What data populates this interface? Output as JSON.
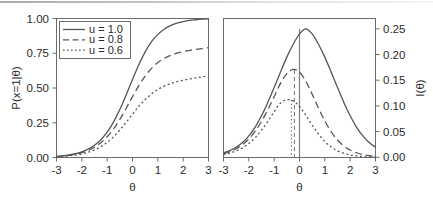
{
  "figure": {
    "background": "#ffffff",
    "ink_color": "#555555",
    "text_color": "#2b2b2b"
  },
  "chart_data": [
    {
      "type": "line",
      "panel": "left",
      "title": "",
      "xlabel": "θ",
      "ylabel": "P(x=1|θ)",
      "xlim": [
        -3,
        3
      ],
      "ylim": [
        0,
        1
      ],
      "xticks": [
        -3,
        -2,
        -1,
        0,
        1,
        2,
        3
      ],
      "xticklabels": [
        "-3",
        "-2",
        "-1",
        "0",
        "1",
        "2",
        "3"
      ],
      "yticks": [
        0.0,
        0.25,
        0.5,
        0.75,
        1.0
      ],
      "yticklabels": [
        "0.00",
        "0.25",
        "0.50",
        "0.75",
        "1.00"
      ],
      "grid": false,
      "legend_position": "upper left",
      "legend_entries": [
        "u = 1.0",
        "u = 0.8",
        "u = 0.6"
      ],
      "x": [
        -3,
        -2.75,
        -2.5,
        -2.25,
        -2,
        -1.75,
        -1.5,
        -1.25,
        -1,
        -0.75,
        -0.5,
        -0.25,
        0,
        0.25,
        0.5,
        0.75,
        1,
        1.25,
        1.5,
        1.75,
        2,
        2.25,
        2.5,
        2.75,
        3
      ],
      "series": [
        {
          "name": "u = 1.0",
          "style": "solid",
          "upper_asymptote": 1.0,
          "values": [
            0.008,
            0.012,
            0.018,
            0.027,
            0.041,
            0.06,
            0.088,
            0.128,
            0.182,
            0.254,
            0.345,
            0.45,
            0.562,
            0.668,
            0.76,
            0.833,
            0.886,
            0.923,
            0.949,
            0.966,
            0.978,
            0.986,
            0.991,
            0.995,
            0.998
          ]
        },
        {
          "name": "u = 0.8",
          "style": "dashed",
          "upper_asymptote": 0.8,
          "values": [
            0.007,
            0.011,
            0.016,
            0.024,
            0.035,
            0.051,
            0.074,
            0.106,
            0.149,
            0.205,
            0.274,
            0.354,
            0.437,
            0.517,
            0.586,
            0.641,
            0.683,
            0.713,
            0.735,
            0.751,
            0.762,
            0.771,
            0.778,
            0.784,
            0.79
          ]
        },
        {
          "name": "u = 0.6",
          "style": "dotted",
          "upper_asymptote": 0.6,
          "values": [
            0.005,
            0.008,
            0.012,
            0.018,
            0.026,
            0.038,
            0.055,
            0.078,
            0.109,
            0.149,
            0.198,
            0.253,
            0.312,
            0.368,
            0.417,
            0.457,
            0.489,
            0.513,
            0.531,
            0.545,
            0.556,
            0.565,
            0.573,
            0.58,
            0.588
          ]
        }
      ]
    },
    {
      "type": "line",
      "panel": "right",
      "title": "",
      "xlabel": "θ",
      "ylabel": "I(θ)",
      "ylabel_side": "right",
      "xlim": [
        -3,
        3
      ],
      "ylim": [
        0,
        0.27
      ],
      "xticks": [
        -3,
        -2,
        -1,
        0,
        1,
        2,
        3
      ],
      "xticklabels": [
        "-3",
        "-2",
        "-1",
        "0",
        "1",
        "2",
        "3"
      ],
      "yticks": [
        0.0,
        0.05,
        0.1,
        0.15,
        0.2,
        0.25
      ],
      "yticklabels": [
        "0.00",
        "0.05",
        "0.10",
        "0.15",
        "0.20",
        "0.25"
      ],
      "grid": false,
      "legend_position": "none",
      "peak_markers": [
        {
          "series": "u = 1.0",
          "x": 0.0,
          "y": 0.25,
          "style": "solid"
        },
        {
          "series": "u = 0.8",
          "x": -0.2,
          "y": 0.17,
          "style": "dashed"
        },
        {
          "series": "u = 0.6",
          "x": -0.32,
          "y": 0.112,
          "style": "dotted"
        }
      ],
      "x": [
        -3,
        -2.75,
        -2.5,
        -2.25,
        -2,
        -1.75,
        -1.5,
        -1.25,
        -1,
        -0.75,
        -0.5,
        -0.25,
        0,
        0.25,
        0.5,
        0.75,
        1,
        1.25,
        1.5,
        1.75,
        2,
        2.25,
        2.5,
        2.75,
        3
      ],
      "series": [
        {
          "name": "u = 1.0",
          "style": "solid",
          "values": [
            0.009,
            0.0135,
            0.02,
            0.029,
            0.042,
            0.059,
            0.081,
            0.107,
            0.136,
            0.166,
            0.195,
            0.22,
            0.24,
            0.25,
            0.24,
            0.22,
            0.195,
            0.166,
            0.136,
            0.107,
            0.081,
            0.059,
            0.042,
            0.029,
            0.02
          ]
        },
        {
          "name": "u = 0.8",
          "style": "dashed",
          "values": [
            0.0075,
            0.0115,
            0.017,
            0.025,
            0.036,
            0.051,
            0.07,
            0.093,
            0.118,
            0.144,
            0.163,
            0.171,
            0.166,
            0.148,
            0.123,
            0.096,
            0.071,
            0.05,
            0.034,
            0.0225,
            0.0145,
            0.0092,
            0.0058,
            0.0036,
            0.0022
          ]
        },
        {
          "name": "u = 0.6",
          "style": "dotted",
          "values": [
            0.0055,
            0.0085,
            0.0128,
            0.0188,
            0.0272,
            0.0385,
            0.053,
            0.07,
            0.089,
            0.106,
            0.112,
            0.11,
            0.099,
            0.082,
            0.063,
            0.0455,
            0.031,
            0.0205,
            0.013,
            0.0082,
            0.005,
            0.0031,
            0.0019,
            0.0011,
            0.0007
          ]
        }
      ]
    }
  ],
  "left_panel": {
    "ylabel": "P(x=1|θ)",
    "xlabel": "θ",
    "yticklabels": [
      "1.00",
      "0.75",
      "0.50",
      "0.25",
      "0.00"
    ],
    "xticklabels": [
      "-3",
      "-2",
      "-1",
      "0",
      "1",
      "2",
      "3"
    ],
    "legend": {
      "items": [
        {
          "label": "u = 1.0",
          "style": "solid"
        },
        {
          "label": "u = 0.8",
          "style": "dashed"
        },
        {
          "label": "u = 0.6",
          "style": "dotted"
        }
      ]
    }
  },
  "right_panel": {
    "ylabel": "I(θ)",
    "xlabel": "θ",
    "yticklabels": [
      "0.25",
      "0.20",
      "0.15",
      "0.10",
      "0.05",
      "0.00"
    ],
    "xticklabels": [
      "-3",
      "-2",
      "-1",
      "0",
      "1",
      "2",
      "3"
    ]
  }
}
